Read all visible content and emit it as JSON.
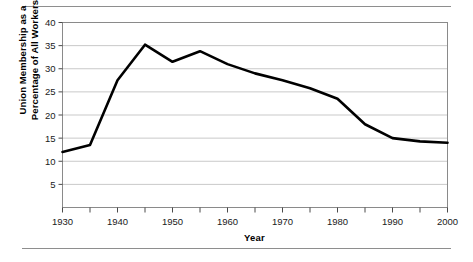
{
  "chart_data": {
    "type": "line",
    "title": "",
    "xlabel": "Year",
    "ylabel": "Union Membership as a Percentage of All Workers",
    "ylabel_line1": "Union Membership as a",
    "ylabel_line2": "Percentage of All Workers",
    "x": [
      1930,
      1935,
      1940,
      1945,
      1950,
      1955,
      1960,
      1965,
      1970,
      1975,
      1980,
      1985,
      1990,
      1995,
      2000
    ],
    "values": [
      12.0,
      13.5,
      27.5,
      35.2,
      31.5,
      33.8,
      31.0,
      29.0,
      27.5,
      25.8,
      23.5,
      18.0,
      15.0,
      14.3,
      14.0
    ],
    "series": [
      {
        "name": "Union membership",
        "values": [
          12.0,
          13.5,
          27.5,
          35.2,
          31.5,
          33.8,
          31.0,
          29.0,
          27.5,
          25.8,
          23.5,
          18.0,
          15.0,
          14.3,
          14.0
        ]
      }
    ],
    "xlim": [
      1930,
      2000
    ],
    "ylim": [
      0,
      40
    ],
    "xticks": [
      1930,
      1940,
      1950,
      1960,
      1970,
      1980,
      1990,
      2000
    ],
    "xtick_labels": [
      "1930",
      "1940",
      "1950",
      "1960",
      "1970",
      "1980",
      "1990",
      "2000"
    ],
    "xminor_ticks": [
      1935,
      1945,
      1955,
      1965,
      1975,
      1985,
      1995
    ],
    "yticks": [
      5,
      10,
      15,
      20,
      25,
      30,
      35,
      40
    ],
    "ytick_labels": [
      "5",
      "10",
      "15",
      "20",
      "25",
      "30",
      "35",
      "40"
    ],
    "grid": "horizontal",
    "legend": "none",
    "line_color": "#000000",
    "grid_color": "#c9c9c9",
    "frame_color": "#8a8a8a"
  },
  "figure": {
    "rule_color": "#8e8e8e"
  }
}
